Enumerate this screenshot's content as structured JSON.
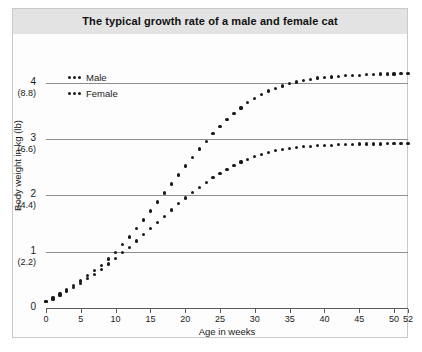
{
  "chart_data": {
    "type": "scatter",
    "title": "The typical growth rate of a male and female cat",
    "xlabel": "Age in weeks",
    "ylabel": "Body weight in kg (lb)",
    "xlim": [
      0,
      52
    ],
    "ylim": [
      0,
      4.4
    ],
    "grid": true,
    "legend_position": "top-left",
    "xticks": [
      0,
      5,
      10,
      15,
      20,
      25,
      30,
      35,
      40,
      45,
      50,
      52
    ],
    "xtick_labels": [
      "0",
      "5",
      "10",
      "15",
      "20",
      "25",
      "30",
      "35",
      "40",
      "45",
      "50",
      "52"
    ],
    "yticks": [
      0,
      1,
      2,
      3,
      4
    ],
    "ytick_labels": [
      "0",
      "1",
      "2",
      "3",
      "4"
    ],
    "ytick_sublabels": [
      "",
      "(2.2)",
      "(4.4)",
      "(6.6)",
      "(8.8)"
    ],
    "x": [
      0,
      1,
      2,
      3,
      4,
      5,
      6,
      7,
      8,
      9,
      10,
      11,
      12,
      13,
      14,
      15,
      16,
      17,
      18,
      19,
      20,
      21,
      22,
      23,
      24,
      25,
      26,
      27,
      28,
      29,
      30,
      31,
      32,
      33,
      34,
      35,
      36,
      37,
      38,
      39,
      40,
      41,
      42,
      43,
      44,
      45,
      46,
      47,
      48,
      49,
      50,
      51,
      52
    ],
    "series": [
      {
        "name": "Male",
        "values": [
          0.12,
          0.18,
          0.25,
          0.32,
          0.4,
          0.48,
          0.57,
          0.66,
          0.76,
          0.87,
          0.99,
          1.12,
          1.26,
          1.41,
          1.56,
          1.72,
          1.88,
          2.04,
          2.2,
          2.36,
          2.52,
          2.67,
          2.82,
          2.96,
          3.09,
          3.22,
          3.34,
          3.45,
          3.55,
          3.64,
          3.72,
          3.79,
          3.85,
          3.9,
          3.94,
          3.98,
          4.01,
          4.04,
          4.06,
          4.08,
          4.09,
          4.1,
          4.11,
          4.12,
          4.13,
          4.13,
          4.14,
          4.14,
          4.15,
          4.15,
          4.15,
          4.16,
          4.16
        ]
      },
      {
        "name": "Female",
        "values": [
          0.11,
          0.16,
          0.22,
          0.29,
          0.36,
          0.44,
          0.52,
          0.6,
          0.69,
          0.78,
          0.88,
          0.98,
          1.08,
          1.19,
          1.3,
          1.41,
          1.52,
          1.63,
          1.74,
          1.85,
          1.95,
          2.05,
          2.14,
          2.23,
          2.31,
          2.39,
          2.46,
          2.53,
          2.59,
          2.64,
          2.69,
          2.73,
          2.76,
          2.79,
          2.81,
          2.83,
          2.85,
          2.86,
          2.87,
          2.88,
          2.89,
          2.89,
          2.9,
          2.9,
          2.9,
          2.91,
          2.91,
          2.91,
          2.91,
          2.92,
          2.92,
          2.92,
          2.92
        ]
      }
    ]
  },
  "legend": {
    "entries": [
      {
        "label": "Male"
      },
      {
        "label": "Female"
      }
    ]
  },
  "colors": {
    "marker": "#1a1a1a",
    "grid": "#8e8e8e",
    "title_band": "#e3e3e3",
    "frame": "#c9c9c9"
  }
}
